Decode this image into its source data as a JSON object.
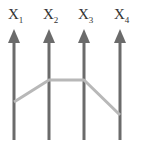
{
  "diagram": {
    "type": "parallel-coordinates",
    "axes": [
      {
        "label": "X",
        "sub": "1"
      },
      {
        "label": "X",
        "sub": "2"
      },
      {
        "label": "X",
        "sub": "3"
      },
      {
        "label": "X",
        "sub": "4"
      }
    ],
    "axis_color": "#6b6b6b",
    "line_color": "#b8b8b8",
    "polyline_y": [
      102,
      80,
      80,
      115
    ]
  }
}
